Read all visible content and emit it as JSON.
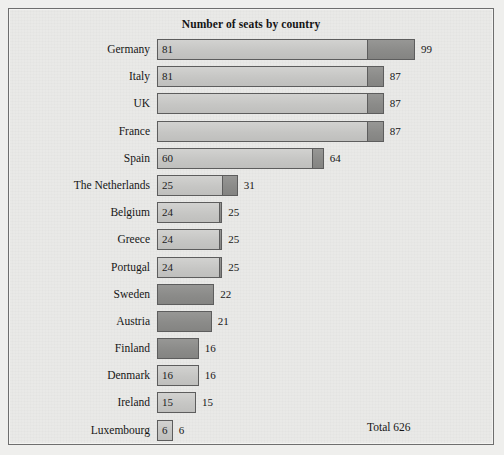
{
  "chart_data": {
    "type": "bar",
    "title": "Number of seats by country",
    "xlabel": "",
    "ylabel": "",
    "orientation": "horizontal",
    "stacked": true,
    "grid": false,
    "xlim": [
      0,
      99
    ],
    "categories": [
      "Germany",
      "Italy",
      "UK",
      "France",
      "Spain",
      "The Netherlands",
      "Belgium",
      "Greece",
      "Portugal",
      "Sweden",
      "Austria",
      "Finland",
      "Denmark",
      "Ireland",
      "Luxembourg"
    ],
    "series": [
      {
        "name": "1989",
        "values": [
          81,
          81,
          81,
          81,
          60,
          25,
          24,
          24,
          24,
          0,
          0,
          0,
          16,
          15,
          6
        ]
      },
      {
        "name": "1995",
        "values": [
          99,
          87,
          87,
          87,
          64,
          31,
          25,
          25,
          25,
          22,
          21,
          16,
          16,
          15,
          6
        ]
      }
    ],
    "bars": [
      {
        "country": "Germany",
        "old": 81,
        "new": 99,
        "old_label": "81",
        "new_label": "99"
      },
      {
        "country": "Italy",
        "old": 81,
        "new": 87,
        "old_label": "81",
        "new_label": "87"
      },
      {
        "country": "UK",
        "old": 81,
        "new": 87,
        "old_label": "",
        "new_label": "87"
      },
      {
        "country": "France",
        "old": 81,
        "new": 87,
        "old_label": "",
        "new_label": "87"
      },
      {
        "country": "Spain",
        "old": 60,
        "new": 64,
        "old_label": "60",
        "new_label": "64"
      },
      {
        "country": "The Netherlands",
        "old": 25,
        "new": 31,
        "old_label": "25",
        "new_label": "31"
      },
      {
        "country": "Belgium",
        "old": 24,
        "new": 25,
        "old_label": "24",
        "new_label": "25"
      },
      {
        "country": "Greece",
        "old": 24,
        "new": 25,
        "old_label": "24",
        "new_label": "25"
      },
      {
        "country": "Portugal",
        "old": 24,
        "new": 25,
        "old_label": "24",
        "new_label": "25"
      },
      {
        "country": "Sweden",
        "old": 0,
        "new": 22,
        "old_label": "",
        "new_label": "22"
      },
      {
        "country": "Austria",
        "old": 0,
        "new": 21,
        "old_label": "",
        "new_label": "21"
      },
      {
        "country": "Finland",
        "old": 0,
        "new": 16,
        "old_label": "",
        "new_label": "16"
      },
      {
        "country": "Denmark",
        "old": 16,
        "new": 16,
        "old_label": "16",
        "new_label": "16"
      },
      {
        "country": "Ireland",
        "old": 15,
        "new": 15,
        "old_label": "15",
        "new_label": "15"
      },
      {
        "country": "Luxembourg",
        "old": 6,
        "new": 6,
        "old_label": "6",
        "new_label": "6"
      }
    ],
    "legend": {
      "position": "bottom",
      "prefix": "Key:",
      "old_label": "1989",
      "new_label": "1995",
      "old_span": 27,
      "new_span": 7
    },
    "annotations": {
      "total": "Total 626"
    },
    "colors": {
      "old_fill": "#c9c9c7",
      "new_fill": "#8e8e8c",
      "bar_border": "#5d5d5d",
      "background": "#e9e9e7",
      "frame": "#6e6e6e",
      "text": "#161616"
    }
  }
}
